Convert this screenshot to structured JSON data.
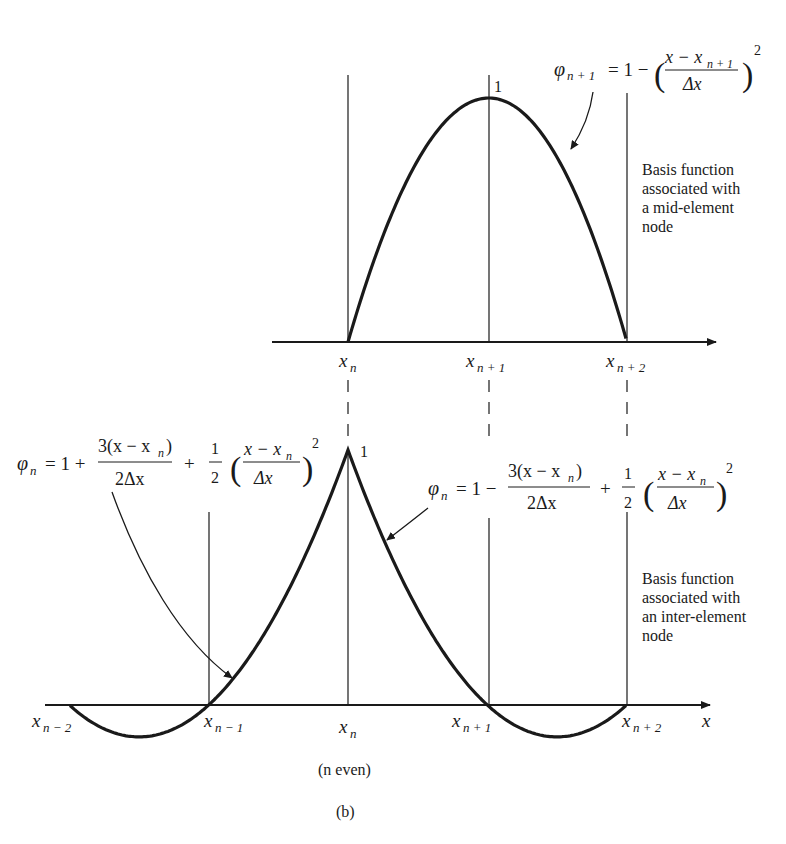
{
  "figure": {
    "caption": "(b)",
    "condition": "(n even)",
    "axis_variable": "x",
    "peak_label": "1"
  },
  "top_panel": {
    "description_lines": [
      "Basis function",
      "associated with",
      "a mid-element",
      "node"
    ],
    "formula": {
      "lhs_symbol": "φ",
      "lhs_sub": "n + 1",
      "rhs_prefix": "= 1 −",
      "frac_num_a": "x − x",
      "frac_num_sub": "n + 1",
      "frac_den": "Δx",
      "exponent": "2"
    },
    "node_labels": [
      {
        "base": "x",
        "sub": "n"
      },
      {
        "base": "x",
        "sub": "n + 1"
      },
      {
        "base": "x",
        "sub": "n + 2"
      }
    ]
  },
  "bottom_panel": {
    "description_lines": [
      "Basis function",
      "associated with",
      "an inter-element",
      "node"
    ],
    "formula_left": {
      "lhs_symbol": "φ",
      "lhs_sub": "n",
      "eq": "= 1 +",
      "frac1_num": "3(x − x",
      "frac1_num_sub": "n",
      "frac1_num_end": ")",
      "frac1_den": "2Δx",
      "plus": "+",
      "half_num": "1",
      "half_den": "2",
      "frac2_num": "x − x",
      "frac2_num_sub": "n",
      "frac2_den": "Δx",
      "exponent": "2"
    },
    "formula_right": {
      "lhs_symbol": "φ",
      "lhs_sub": "n",
      "eq": "= 1 −",
      "frac1_num": "3(x − x",
      "frac1_num_sub": "n",
      "frac1_num_end": ")",
      "frac1_den": "2Δx",
      "plus": "+",
      "half_num": "1",
      "half_den": "2",
      "frac2_num": "x − x",
      "frac2_num_sub": "n",
      "frac2_den": "Δx",
      "exponent": "2"
    },
    "node_labels": [
      {
        "base": "x",
        "sub": "n − 2"
      },
      {
        "base": "x",
        "sub": "n − 1"
      },
      {
        "base": "x",
        "sub": "n"
      },
      {
        "base": "x",
        "sub": "n + 1"
      },
      {
        "base": "x",
        "sub": "n + 2"
      }
    ]
  },
  "colors": {
    "ink": "#1a1a1a",
    "background": "#ffffff"
  }
}
